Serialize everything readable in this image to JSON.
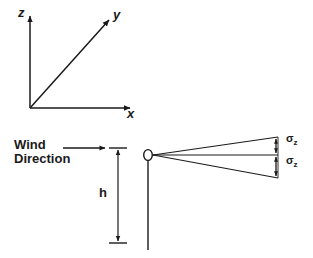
{
  "figure": {
    "background_color": "#ffffff",
    "stroke_color": "#1a1a1a"
  },
  "coordinate_axes": {
    "name": "3d-coordinate-axes",
    "z_axis_label": "z",
    "y_axis_label": "y",
    "x_axis_label": "x",
    "origin": {
      "x": 30,
      "y": 108
    },
    "z_tip": {
      "x": 30,
      "y": 14
    },
    "x_tip": {
      "x": 132,
      "y": 108
    },
    "y_tip": {
      "x": 110,
      "y": 19
    }
  },
  "plume": {
    "wind_direction_label": "Wind\nDirection",
    "wind_arrow": {
      "x_start": 63,
      "x_end": 106,
      "y": 148
    },
    "stack_height_label": "h",
    "stack": {
      "name": "emission-stack",
      "x": 148,
      "top_y": 156,
      "bottom_y": 250,
      "source_marker": "open-circle"
    },
    "height_dimension": {
      "x": 118,
      "top_y": 148,
      "bottom_y": 243
    },
    "centerline": {
      "x_start": 152,
      "x_end": 278,
      "y": 155
    },
    "upper_edge_end": {
      "x": 278,
      "y": 137
    },
    "lower_edge_end": {
      "x": 278,
      "y": 178
    },
    "sigma_upper_label": "σ",
    "sigma_upper_subscript": "z",
    "sigma_lower_label": "σ",
    "sigma_lower_subscript": "z",
    "sigma_arrow_x": 276
  }
}
